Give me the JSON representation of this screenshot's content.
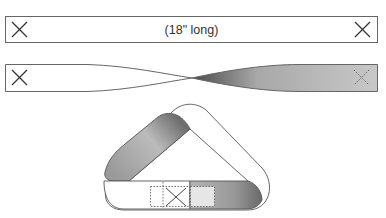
{
  "diagram": {
    "steps": [
      {
        "id": "flat-strip",
        "label": "(18\" long)",
        "end_marks": [
          "X",
          "X"
        ]
      },
      {
        "id": "half-twisted-strip",
        "label": "",
        "end_marks": [
          "X",
          "X (dotted, back side)"
        ]
      },
      {
        "id": "joined-mobius-loop",
        "label": "",
        "overlap_mark": "X"
      }
    ],
    "colors": {
      "outline": "#555555",
      "shade_dark": "#6a6a6a",
      "shade_light": "#e0e0e0",
      "background": "#ffffff"
    }
  }
}
